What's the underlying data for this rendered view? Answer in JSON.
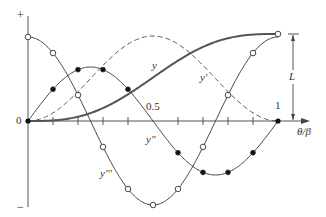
{
  "diagram": {
    "axis_labels": {
      "plus": "+",
      "minus": "−",
      "origin": "0",
      "half": "0.5",
      "one": "1",
      "x_axis": "θ/β",
      "dimension": "L"
    },
    "curve_labels": {
      "displacement": "y",
      "velocity": "y'",
      "acceleration": "y\"",
      "jerk": "y'''"
    },
    "colors": {
      "line": "#3a3a3a",
      "background": "#ffffff"
    }
  },
  "chart_data": {
    "type": "line",
    "title": "",
    "xlabel": "θ/β",
    "ylabel": "",
    "xlim": [
      0,
      1
    ],
    "x_ticks": [
      0,
      0.1,
      0.2,
      0.3,
      0.4,
      0.5,
      0.6,
      0.7,
      0.8,
      0.9,
      1
    ],
    "x_tick_labels": {
      "0": "0",
      "0.5": "0.5",
      "1": "1"
    },
    "series": [
      {
        "name": "y",
        "style": "thick solid",
        "description": "displacement rising 0 to L",
        "x": [
          0,
          0.1,
          0.2,
          0.3,
          0.4,
          0.5,
          0.6,
          0.7,
          0.8,
          0.9,
          1
        ],
        "values": [
          0,
          0.006,
          0.049,
          0.149,
          0.306,
          0.5,
          0.694,
          0.851,
          0.951,
          0.994,
          1
        ]
      },
      {
        "name": "y'",
        "style": "dashed",
        "description": "velocity",
        "x": [
          0,
          0.1,
          0.2,
          0.3,
          0.4,
          0.5,
          0.6,
          0.7,
          0.8,
          0.9,
          1
        ],
        "values": [
          0,
          0.19,
          0.69,
          1.31,
          1.81,
          2.0,
          1.81,
          1.31,
          0.69,
          0.19,
          0
        ]
      },
      {
        "name": "y\"",
        "style": "solid, filled markers",
        "description": "acceleration",
        "x": [
          0,
          0.1,
          0.2,
          0.3,
          0.4,
          0.5,
          0.6,
          0.7,
          0.8,
          0.9,
          1
        ],
        "values": [
          0,
          0.59,
          0.95,
          0.95,
          0.59,
          0,
          -0.59,
          -0.95,
          -0.95,
          -0.59,
          0
        ]
      },
      {
        "name": "y'''",
        "style": "solid, open markers",
        "description": "jerk",
        "x": [
          0,
          0.1,
          0.2,
          0.3,
          0.4,
          0.5,
          0.6,
          0.7,
          0.8,
          0.9,
          1
        ],
        "values": [
          1,
          0.81,
          0.31,
          -0.31,
          -0.81,
          -1,
          -0.81,
          -0.31,
          0.31,
          0.81,
          1
        ]
      }
    ],
    "annotations": [
      "L dimension from 0 to max displacement at θ/β = 1",
      "+ at top of vertical axis",
      "− at bottom of vertical axis"
    ],
    "grid": false,
    "legend": "inline curve labels"
  }
}
